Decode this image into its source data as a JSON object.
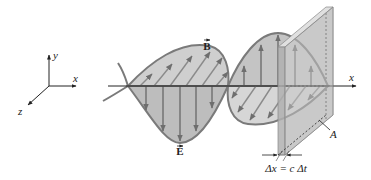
{
  "figure": {
    "axes_triad": {
      "y_label": "y",
      "x_label": "x",
      "z_label": "z"
    },
    "wave_labels": {
      "B_field": "B",
      "E_field": "E"
    },
    "propagation_axis_label": "x",
    "slab_area_label": "A",
    "slab_thickness_label": "Δx = c Δt",
    "colors": {
      "wave_fill": "#c9c9c9",
      "wave_outline": "#7a7a7a",
      "field_arrow": "#6e6e6e",
      "axis": "#222222",
      "slab_front": "#b5b5b5",
      "slab_side": "#d6d6d6",
      "slab_top": "#e0e0e0",
      "background": "#ffffff"
    }
  }
}
